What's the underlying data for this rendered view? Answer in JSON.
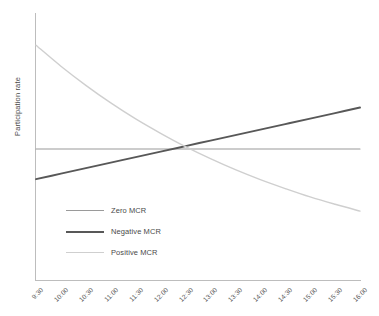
{
  "chart_data": {
    "type": "line",
    "title": "",
    "subtitle": "",
    "xlabel": "",
    "ylabel": "Participation rate",
    "grid": false,
    "legend_position": "inside-lower-left",
    "y_tick_labels": [],
    "x_tick_labels": [
      "9:30",
      "10:00",
      "10:30",
      "11:00",
      "11:30",
      "12:00",
      "12:30",
      "13:00",
      "13:30",
      "14:00",
      "14:30",
      "15:00",
      "15:30",
      "16:00"
    ],
    "x": [
      "9:30",
      "10:00",
      "10:30",
      "11:00",
      "11:30",
      "12:00",
      "12:30",
      "13:00",
      "13:30",
      "14:00",
      "14:30",
      "15:00",
      "15:30",
      "16:00"
    ],
    "xlim": [
      0,
      13
    ],
    "ylim": [
      0,
      100
    ],
    "series": [
      {
        "name": "Zero MCR",
        "color": "#9a9a9a",
        "width": 1.1,
        "values": [
          50,
          50,
          50,
          50,
          50,
          50,
          50,
          50,
          50,
          50,
          50,
          50,
          50,
          50
        ]
      },
      {
        "name": "Negative MCR",
        "color": "#585858",
        "width": 2.0,
        "values": [
          38.5,
          40.6,
          42.7,
          44.8,
          46.9,
          49.0,
          51.1,
          53.2,
          55.3,
          57.4,
          59.5,
          61.6,
          63.7,
          65.8
        ]
      },
      {
        "name": "Positive MCR",
        "color": "#cfcfcf",
        "width": 1.4,
        "values": [
          89.6,
          81.6,
          74.3,
          67.6,
          61.5,
          56.0,
          50.9,
          46.3,
          42.1,
          38.3,
          34.9,
          31.7,
          28.9,
          26.3
        ]
      }
    ]
  },
  "legend": {
    "items": [
      {
        "label": "Zero MCR"
      },
      {
        "label": "Negative MCR"
      },
      {
        "label": "Positive MCR"
      }
    ]
  },
  "axes": {
    "y_title": "Participation rate",
    "axis_color": "#bdbdbd"
  }
}
